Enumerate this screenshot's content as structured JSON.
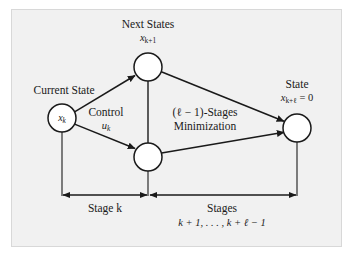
{
  "figure": {
    "background_color": "#ffffff",
    "panel_color": "#f1f1f1",
    "ink_color": "#1a1a1a",
    "node_fill": "#ffffff"
  },
  "labels": {
    "next_states": "Next States",
    "next_states_math_base": "x",
    "next_states_math_sub": "k+1",
    "current_state": "Current State",
    "control": "Control",
    "control_math_base": "u",
    "control_math_sub": "k",
    "minimization_line1": "(ℓ − 1)-Stages",
    "minimization_line2": "Minimization",
    "state": "State",
    "state_math_base": "x",
    "state_math_sub": "k+ℓ",
    "state_math_tail": " = 0",
    "stage_k": "Stage k",
    "stages": "Stages",
    "stages_range": "k + 1, . . . , k + ℓ − 1"
  },
  "nodes": [
    {
      "id": "current-state-node",
      "label": "x_k",
      "label_base": "x",
      "label_sub": "k",
      "cx": 62,
      "cy": 118,
      "r": 14
    },
    {
      "id": "next-state-top-node",
      "label": "",
      "label_base": "",
      "label_sub": "",
      "cx": 148,
      "cy": 67,
      "r": 14
    },
    {
      "id": "next-state-bottom-node",
      "label": "",
      "label_base": "",
      "label_sub": "",
      "cx": 148,
      "cy": 157,
      "r": 14
    },
    {
      "id": "terminal-state-node",
      "label": "",
      "label_base": "",
      "label_sub": "",
      "cx": 297,
      "cy": 128,
      "r": 14
    }
  ],
  "edges": [
    {
      "id": "edge-current-to-top",
      "from": "current-state-node",
      "to": "next-state-top-node"
    },
    {
      "id": "edge-current-to-bottom",
      "from": "current-state-node",
      "to": "next-state-bottom-node"
    },
    {
      "id": "edge-top-to-terminal",
      "from": "next-state-top-node",
      "to": "terminal-state-node"
    },
    {
      "id": "edge-bottom-to-terminal",
      "from": "next-state-bottom-node",
      "to": "terminal-state-node"
    }
  ],
  "measure_bars": [
    {
      "id": "stage-k-bar",
      "x_start": 62,
      "x_end": 148,
      "y": 195,
      "label": "Stage k"
    },
    {
      "id": "stages-bar",
      "x_start": 148,
      "x_end": 297,
      "y": 195,
      "label": "Stages"
    }
  ]
}
